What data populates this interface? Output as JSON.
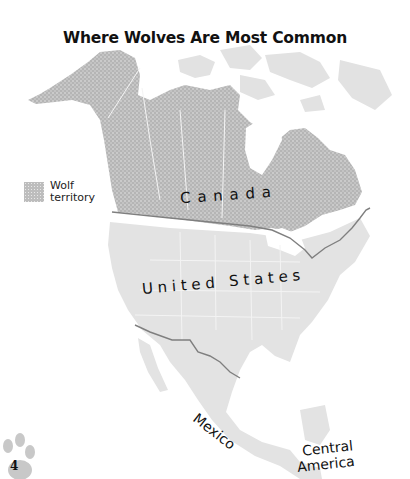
{
  "title": "Where Wolves Are Most Common",
  "legend": {
    "line1": "Wolf",
    "line2": "territory"
  },
  "regions": {
    "canada": "C a n a d a",
    "us": "U n i t e d   S t a t e s",
    "mexico": "Mexico",
    "central_america_1": "Central",
    "central_america_2": "America"
  },
  "page_number": "4",
  "colors": {
    "wolf_territory": "#b8b8b8",
    "land": "#e3e3e3",
    "border": "#888888",
    "water": "#ffffff"
  }
}
